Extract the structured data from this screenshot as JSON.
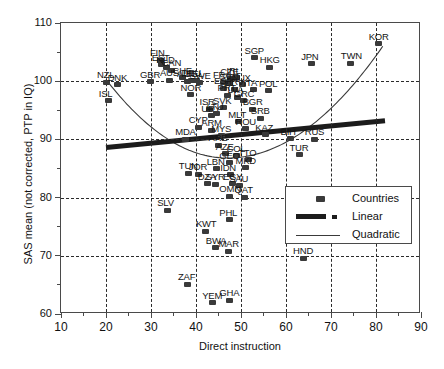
{
  "chart_data": {
    "type": "scatter",
    "title": "",
    "xlabel": "Direct instruction",
    "ylabel": "SAS mean (not corrected, PTP in IQ)",
    "xlim": [
      10,
      90
    ],
    "ylim": [
      60,
      110
    ],
    "xticks": [
      10,
      20,
      30,
      40,
      50,
      60,
      70,
      80,
      90
    ],
    "yticks": [
      60,
      70,
      80,
      90,
      100,
      110
    ],
    "xminorticks": [
      15,
      25,
      35,
      45,
      55,
      65,
      75,
      85
    ],
    "yminorticks": [
      65,
      75,
      85,
      95,
      105
    ],
    "grid": "dashed gridlines at major x and y ticks",
    "legend_position": "inside lower right",
    "series": [
      {
        "name": "Countries",
        "marker": "filled rounded square",
        "color": "#3a3a3a",
        "points": [
          {
            "label": "NZL",
            "x": 20.2,
            "y": 99.8
          },
          {
            "label": "ISL",
            "x": 20.6,
            "y": 96.6
          },
          {
            "label": "DNK",
            "x": 22.6,
            "y": 99.4
          },
          {
            "label": "GBR",
            "x": 29.8,
            "y": 99.9
          },
          {
            "label": "FIN",
            "x": 32.0,
            "y": 103.6
          },
          {
            "label": "EST",
            "x": 32.4,
            "y": 102.8
          },
          {
            "label": "NLD",
            "x": 33.4,
            "y": 102.4
          },
          {
            "label": "CAN",
            "x": 34.6,
            "y": 101.9
          },
          {
            "label": "AUS",
            "x": 34.2,
            "y": 100.2
          },
          {
            "label": "CHE",
            "x": 37.0,
            "y": 100.6
          },
          {
            "label": "AUT",
            "x": 38.0,
            "y": 100.0
          },
          {
            "label": "DEU",
            "x": 39.0,
            "y": 100.2
          },
          {
            "label": "BEL",
            "x": 40.0,
            "y": 100.1
          },
          {
            "label": "SWE",
            "x": 40.8,
            "y": 99.7
          },
          {
            "label": "NOR",
            "x": 38.8,
            "y": 97.7
          },
          {
            "label": "ISR",
            "x": 43.0,
            "y": 95.2
          },
          {
            "label": "URY",
            "x": 43.4,
            "y": 94.1
          },
          {
            "label": "CYP",
            "x": 40.6,
            "y": 92.1
          },
          {
            "label": "ARM",
            "x": 43.4,
            "y": 91.6
          },
          {
            "label": "MDA",
            "x": 37.6,
            "y": 90.0
          },
          {
            "label": "MYS",
            "x": 45.6,
            "y": 90.6
          },
          {
            "label": "ARE",
            "x": 45.0,
            "y": 89.0
          },
          {
            "label": "SGP",
            "x": 53.0,
            "y": 104.0
          },
          {
            "label": "HKG",
            "x": 56.4,
            "y": 102.4
          },
          {
            "label": "JPN",
            "x": 65.6,
            "y": 103.0
          },
          {
            "label": "KOR",
            "x": 80.6,
            "y": 106.4
          },
          {
            "label": "TWN",
            "x": 74.4,
            "y": 103.1
          },
          {
            "label": "CZE",
            "x": 47.6,
            "y": 100.4
          },
          {
            "label": "IRL",
            "x": 49.0,
            "y": 100.6
          },
          {
            "label": "FRA",
            "x": 46.0,
            "y": 99.8
          },
          {
            "label": "SVN",
            "x": 47.4,
            "y": 99.6
          },
          {
            "label": "LUX",
            "x": 50.4,
            "y": 99.4
          },
          {
            "label": "ESP",
            "x": 46.2,
            "y": 98.8
          },
          {
            "label": "HRV",
            "x": 48.6,
            "y": 98.6
          },
          {
            "label": "ITA",
            "x": 52.8,
            "y": 98.5
          },
          {
            "label": "POL",
            "x": 56.2,
            "y": 98.4
          },
          {
            "label": "PRT",
            "x": 47.0,
            "y": 97.6
          },
          {
            "label": "LVA",
            "x": 49.2,
            "y": 97.2
          },
          {
            "label": "GRC",
            "x": 50.6,
            "y": 96.6
          },
          {
            "label": "BGR",
            "x": 52.6,
            "y": 95.2
          },
          {
            "label": "SVK",
            "x": 46.0,
            "y": 95.4
          },
          {
            "label": "LTU",
            "x": 44.6,
            "y": 94.4
          },
          {
            "label": "SRB",
            "x": 54.4,
            "y": 93.6
          },
          {
            "label": "MLT",
            "x": 49.4,
            "y": 93.0
          },
          {
            "label": "ROU",
            "x": 51.0,
            "y": 91.8
          },
          {
            "label": "KAZ",
            "x": 55.4,
            "y": 90.8
          },
          {
            "label": "BIH",
            "x": 61.0,
            "y": 90.1
          },
          {
            "label": "RUS",
            "x": 66.4,
            "y": 90.0
          },
          {
            "label": "TUR",
            "x": 63.0,
            "y": 87.4
          },
          {
            "label": "AZE",
            "x": 46.6,
            "y": 87.5
          },
          {
            "label": "COL",
            "x": 49.0,
            "y": 87.2
          },
          {
            "label": "TTO",
            "x": 51.6,
            "y": 86.5
          },
          {
            "label": "GEO",
            "x": 47.4,
            "y": 86.0
          },
          {
            "label": "MKD",
            "x": 51.0,
            "y": 85.1
          },
          {
            "label": "LBN",
            "x": 44.6,
            "y": 85.0
          },
          {
            "label": "TUN",
            "x": 38.4,
            "y": 84.2
          },
          {
            "label": "JOR",
            "x": 40.6,
            "y": 84.0
          },
          {
            "label": "IDN",
            "x": 47.6,
            "y": 83.9
          },
          {
            "label": "EGY",
            "x": 48.2,
            "y": 82.4
          },
          {
            "label": "DZA",
            "x": 42.6,
            "y": 82.4
          },
          {
            "label": "SYR",
            "x": 44.4,
            "y": 82.3
          },
          {
            "label": "SAU",
            "x": 49.6,
            "y": 82.0
          },
          {
            "label": "OMN",
            "x": 47.4,
            "y": 80.2
          },
          {
            "label": "QAT",
            "x": 50.8,
            "y": 80.1
          },
          {
            "label": "SLV",
            "x": 33.6,
            "y": 77.8
          },
          {
            "label": "KWT",
            "x": 42.2,
            "y": 74.2
          },
          {
            "label": "BWA",
            "x": 44.4,
            "y": 71.4
          },
          {
            "label": "MAR",
            "x": 47.2,
            "y": 70.8
          },
          {
            "label": "PHL",
            "x": 47.4,
            "y": 76.2
          },
          {
            "label": "HND",
            "x": 63.8,
            "y": 69.6
          },
          {
            "label": "ZAF",
            "x": 38.2,
            "y": 65.1
          },
          {
            "label": "YEM",
            "x": 43.6,
            "y": 61.9
          },
          {
            "label": "GHA",
            "x": 47.4,
            "y": 62.4
          }
        ]
      },
      {
        "name": "Linear",
        "style": "thick black trend line",
        "color": "#1c1c1c",
        "endpoints": {
          "x0": 20.0,
          "y0": 88.6,
          "x1": 82.0,
          "y1": 93.2
        }
      },
      {
        "name": "Quadratic",
        "style": "thin black curve",
        "color": "#3a3a3a",
        "vertex_approx": {
          "x": 47.0,
          "y": 86.8
        },
        "endpoints": {
          "x0": 20.0,
          "y0": 100.3,
          "x1": 81.5,
          "y1": 106.0
        }
      }
    ]
  },
  "legend": {
    "rows": [
      {
        "label": "Countries",
        "symbol": "filled-square-marker"
      },
      {
        "label": "Linear",
        "symbol": "thick-line-segment"
      },
      {
        "label": "Quadratic",
        "symbol": "thin-line-segment"
      }
    ]
  }
}
